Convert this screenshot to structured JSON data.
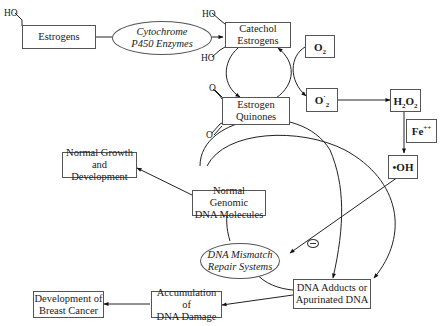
{
  "nodes": {
    "estrogens": {
      "label": "Estrogens"
    },
    "cyp450": {
      "line1": "Cytochrome",
      "line2": "P450 Enzymes"
    },
    "catechol": {
      "line1": "Catechol",
      "line2": "Estrogens"
    },
    "quinones": {
      "line1": "Estrogen",
      "line2": "Quinones"
    },
    "o2": {
      "main": "O",
      "sub": "2"
    },
    "superoxide": {
      "main": "O",
      "sub": "2",
      "sup": "·"
    },
    "h2o2": {
      "h": "H",
      "sub1": "2",
      "o": "O",
      "sub2": "2"
    },
    "fe": {
      "main": "Fe",
      "sup": "++"
    },
    "oh": {
      "label": "•OH"
    },
    "normal_growth": {
      "line1": "Normal Growth",
      "line2": "and Development"
    },
    "normal_dna": {
      "line1": "Normal Genomic",
      "line2": "DNA Molecules"
    },
    "mismatch": {
      "line1": "DNA Mismatch",
      "line2": "Repair Systems"
    },
    "adducts": {
      "line1": "DNA Adducts or",
      "line2": "Apurinated DNA"
    },
    "accumulation": {
      "line1": "Accumulation of",
      "line2": "DNA Damage"
    },
    "cancer": {
      "line1": "Development of",
      "line2": "Breast Cancer"
    }
  },
  "chem_labels": {
    "ho_estrogen": "HO",
    "ho_catechol_top": "HO",
    "ho_catechol_bottom": "HO",
    "o_quinone_top": "O",
    "o_quinone_bottom": "O"
  },
  "annotations": {
    "inhibition_symbol": "minus"
  }
}
